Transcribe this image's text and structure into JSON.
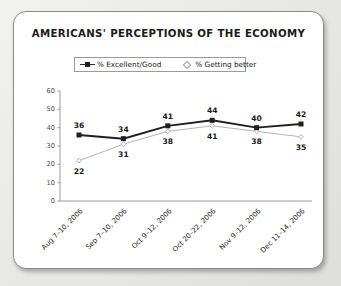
{
  "card": {
    "title": "AMERICANS' PERCEPTIONS OF THE ECONOMY"
  },
  "chart_data": {
    "type": "line",
    "title": "AMERICANS' PERCEPTIONS OF THE ECONOMY",
    "xlabel": "",
    "ylabel": "",
    "ylim": [
      0,
      60
    ],
    "yticks": [
      0,
      10,
      20,
      30,
      40,
      50,
      60
    ],
    "grid": false,
    "legend_position": "top-center",
    "categories": [
      "Aug 7–10, 2006",
      "Sep 7–10, 2006",
      "Oct 9–12, 2006",
      "Oct 20–22, 2006",
      "Nov 9–12, 2006",
      "Dec 11–14, 2006"
    ],
    "series": [
      {
        "name": "% Excellent/Good",
        "marker": "filled-square",
        "color": "#1f1f1f",
        "values": [
          36,
          34,
          41,
          44,
          40,
          42
        ]
      },
      {
        "name": "% Getting better",
        "marker": "open-diamond",
        "color": "#b4b4b4",
        "values": [
          22,
          31,
          38,
          41,
          38,
          35
        ]
      }
    ]
  },
  "axis": {
    "ytick_labels": [
      "60",
      "50",
      "40",
      "30",
      "20",
      "10",
      "0"
    ]
  },
  "legend": {
    "entries": [
      {
        "label": "% Excellent/Good"
      },
      {
        "label": "% Getting better"
      }
    ]
  }
}
